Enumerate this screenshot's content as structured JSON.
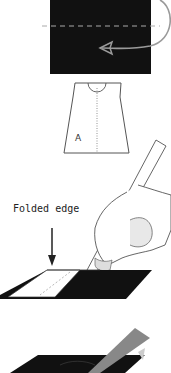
{
  "diagram": {
    "type": "sewing-instructions",
    "steps": [
      {
        "id": "fold-fabric",
        "description": "Fabric folded along dashed line with curved arrow"
      },
      {
        "id": "pattern-piece",
        "description": "Pattern piece outline",
        "label": "A"
      },
      {
        "id": "mark-fold",
        "description": "Hand tracing with marker along folded edge",
        "callout": "Folded edge"
      },
      {
        "id": "cut-fabric",
        "description": "Cutting folded fabric"
      }
    ],
    "labels": {
      "pattern_letter": "A",
      "folded_edge": "Folded edge"
    },
    "colors": {
      "fabric": "#111111",
      "outline": "#444444",
      "arrow": "#9a9a9a",
      "background": "#ffffff"
    }
  }
}
